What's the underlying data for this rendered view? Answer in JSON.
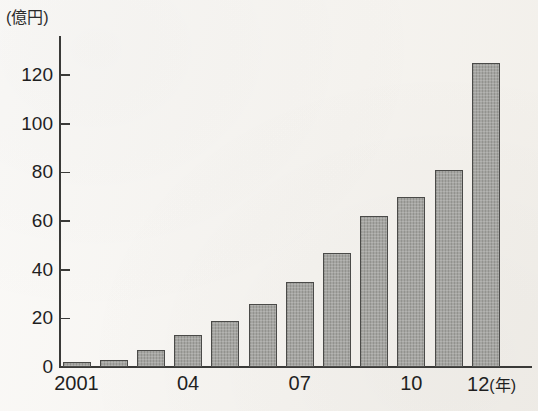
{
  "figure": {
    "unit_caption": "(億円)",
    "x_unit_suffix": "(年)",
    "background_color": "#f6f4f0",
    "bar_fill_color": "#9b9b97",
    "bar_outline_color": "#4a4a48",
    "axis_color": "#3a3a38"
  },
  "chart_data": {
    "type": "bar",
    "title": "",
    "xlabel": "(年)",
    "ylabel": "(億円)",
    "ylim": [
      0,
      132
    ],
    "grid": false,
    "legend": null,
    "categories": [
      "2001",
      "2002",
      "2003",
      "2004",
      "2005",
      "2006",
      "2007",
      "2008",
      "2009",
      "2010",
      "2011",
      "2012"
    ],
    "values": [
      2,
      3,
      7,
      13,
      19,
      26,
      35,
      47,
      62,
      70,
      81,
      125
    ],
    "y_ticks": [
      0,
      20,
      40,
      60,
      80,
      100,
      120
    ],
    "y_tick_labels": [
      "0",
      "20",
      "40",
      "60",
      "80",
      "100",
      "120"
    ],
    "x_tick_labels": [
      "2001",
      "04",
      "07",
      "10",
      "12"
    ],
    "x_tick_categories": [
      "2001",
      "2004",
      "2007",
      "2010",
      "2012"
    ],
    "annotations": []
  },
  "y_axis": {
    "labels": [
      "120",
      "100",
      "80",
      "60",
      "40",
      "20",
      "0"
    ]
  },
  "x_axis": {
    "labels": [
      "2001",
      "04",
      "07",
      "10",
      "12"
    ],
    "unit": "(年)"
  }
}
